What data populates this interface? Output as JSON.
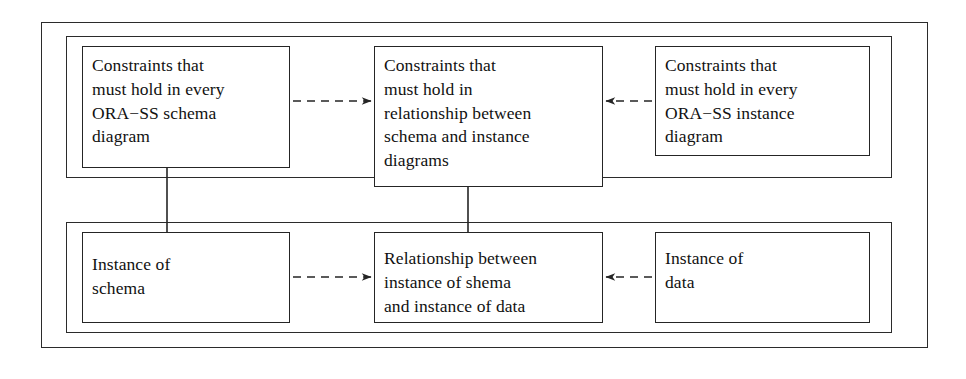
{
  "diagram": {
    "stroke_color": "#252525",
    "background_color": "#ffffff",
    "frames": {
      "outer_label": "outer-frame",
      "top_row_label": "schema-and-instance-constraints-group",
      "bottom_row_label": "instances-group"
    },
    "nodes": [
      {
        "id": "schema-constraints",
        "lines": [
          "Constraints that",
          "must hold in every",
          "ORA−SS schema",
          "diagram"
        ]
      },
      {
        "id": "relationship-constraints",
        "lines": [
          "Constraints that",
          "must hold in",
          "relationship between",
          "schema and instance",
          "diagrams"
        ]
      },
      {
        "id": "instance-constraints",
        "lines": [
          "Constraints that",
          "must hold in every",
          "ORA−SS instance",
          "diagram"
        ]
      },
      {
        "id": "instance-of-schema",
        "lines": [
          "Instance of",
          "schema"
        ]
      },
      {
        "id": "relationship-instances",
        "lines": [
          "Relationship between",
          "instance of shema",
          "and instance of data"
        ]
      },
      {
        "id": "instance-of-data",
        "lines": [
          "Instance of",
          "data"
        ]
      }
    ],
    "connectors": [
      {
        "id": "schema-to-relationship-constraints",
        "style": "dashed",
        "direction": "right",
        "from": "schema-constraints",
        "to": "relationship-constraints"
      },
      {
        "id": "instance-to-relationship-constraints",
        "style": "dashed",
        "direction": "left",
        "from": "instance-constraints",
        "to": "relationship-constraints"
      },
      {
        "id": "instance-of-schema-to-relationship-instances",
        "style": "dashed",
        "direction": "right",
        "from": "instance-of-schema",
        "to": "relationship-instances"
      },
      {
        "id": "instance-of-data-to-relationship-instances",
        "style": "dashed",
        "direction": "left",
        "from": "instance-of-data",
        "to": "relationship-instances"
      },
      {
        "id": "instance-of-schema-to-schema-constraints",
        "style": "solid",
        "direction": "up",
        "from": "instance-of-schema",
        "to": "schema-constraints"
      },
      {
        "id": "relationship-instances-to-relationship-constraints",
        "style": "solid",
        "direction": "up",
        "from": "relationship-instances",
        "to": "relationship-constraints"
      }
    ]
  }
}
